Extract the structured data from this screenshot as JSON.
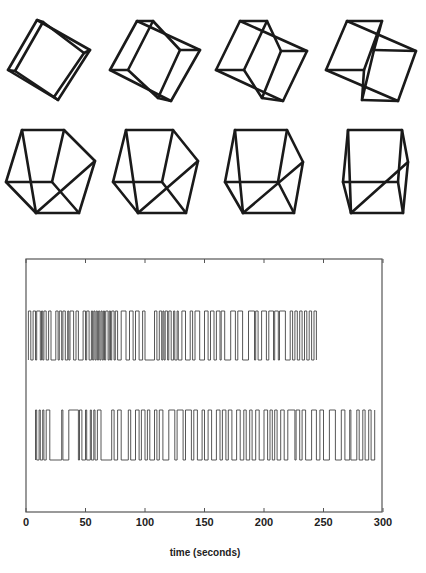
{
  "figure": {
    "cubes": {
      "description": "Necker cube rotation sequence",
      "rows": 2,
      "cols": 4,
      "items": [
        {
          "index": 1,
          "front": [
            [
              37,
              20
            ],
            [
              90,
              50
            ],
            [
              58,
              100
            ],
            [
              8,
              70
            ]
          ],
          "back": [
            [
              43,
              22
            ],
            [
              84,
              53
            ],
            [
              54,
              97
            ],
            [
              15,
              71
            ]
          ]
        },
        {
          "index": 2,
          "front": [
            [
              137,
              21
            ],
            [
              200,
              50
            ],
            [
              171,
              101
            ],
            [
              110,
              70
            ]
          ],
          "back": [
            [
              153,
              21
            ],
            [
              180,
              50
            ],
            [
              158,
              98
            ],
            [
              128,
              70
            ]
          ]
        },
        {
          "index": 3,
          "front": [
            [
              240,
              21
            ],
            [
              307,
              51
            ],
            [
              283,
              101
            ],
            [
              216,
              70
            ]
          ],
          "back": [
            [
              267,
              21
            ],
            [
              281,
              51
            ],
            [
              262,
              98
            ],
            [
              244,
              70
            ]
          ]
        },
        {
          "index": 4,
          "front": [
            [
              347,
              21
            ],
            [
              416,
              51
            ],
            [
              398,
              101
            ],
            [
              326,
              70
            ]
          ],
          "back": [
            [
              382,
              21
            ],
            [
              374,
              50
            ],
            [
              362,
              100
            ],
            [
              364,
              70
            ]
          ]
        },
        {
          "index": 5,
          "front": [
            [
              22,
              130
            ],
            [
              64,
              130
            ],
            [
              95,
              161
            ],
            [
              36,
              213
            ]
          ],
          "back": [
            [
              6,
              182
            ],
            [
              52,
              182
            ],
            [
              79,
              213
            ],
            [
              36,
              213
            ]
          ]
        },
        {
          "index": 6,
          "front": [
            [
              126,
              130
            ],
            [
              173,
              130
            ],
            [
              198,
              161
            ],
            [
              138,
              213
            ]
          ],
          "back": [
            [
              113,
              182
            ],
            [
              162,
              182
            ],
            [
              186,
              213
            ],
            [
              138,
              213
            ]
          ]
        },
        {
          "index": 7,
          "front": [
            [
              235,
              130
            ],
            [
              287,
              130
            ],
            [
              303,
              162
            ],
            [
              243,
              213
            ]
          ],
          "back": [
            [
              225,
              182
            ],
            [
              278,
              182
            ],
            [
              294,
              213
            ],
            [
              243,
              213
            ]
          ]
        },
        {
          "index": 8,
          "front": [
            [
              348,
              130
            ],
            [
              402,
              130
            ],
            [
              408,
              162
            ],
            [
              351,
              213
            ]
          ],
          "back": [
            [
              343,
              182
            ],
            [
              398,
              182
            ],
            [
              403,
              213
            ],
            [
              351,
              213
            ]
          ]
        }
      ]
    },
    "xlabel": "time (seconds)"
  },
  "chart_data": {
    "type": "line",
    "title": "",
    "xlabel": "time (seconds)",
    "ylabel": "",
    "xlim": [
      0,
      300
    ],
    "xticks": [
      0,
      50,
      100,
      150,
      200,
      250,
      300
    ],
    "xtick_labels": [
      "0",
      "50",
      "100",
      "150",
      "200",
      "250",
      "300"
    ],
    "grid": false,
    "legend": null,
    "series": [
      {
        "name": "trace-1 (upper)",
        "description": "binary perceptual switching record",
        "t_start": 2,
        "t_end": 245,
        "switch_times": [
          2,
          4,
          6,
          8,
          9,
          12,
          13,
          14,
          15,
          17,
          19,
          21,
          25,
          27,
          28,
          30,
          31,
          33,
          35,
          36,
          37,
          40,
          42,
          44,
          48,
          50,
          51,
          53,
          55,
          56,
          57,
          58,
          59,
          60,
          61,
          62,
          63,
          64,
          65,
          66,
          67,
          69,
          70,
          71,
          72,
          74,
          75,
          77,
          80,
          84,
          87,
          90,
          92,
          95,
          98,
          100,
          108,
          110,
          112,
          114,
          115,
          116,
          117,
          119,
          120,
          122,
          124,
          125,
          127,
          128,
          131,
          134,
          138,
          140,
          142,
          146,
          150,
          153,
          155,
          158,
          160,
          163,
          164,
          167,
          172,
          176,
          178,
          182,
          187,
          192,
          193,
          195,
          198,
          202,
          204,
          208,
          209,
          212,
          213,
          218,
          222,
          224,
          226,
          228,
          230,
          232,
          234,
          236,
          238,
          240,
          242,
          244
        ]
      },
      {
        "name": "trace-2 (lower)",
        "description": "binary perceptual switching record",
        "t_start": 8,
        "t_end": 293,
        "switch_times": [
          8,
          9,
          11,
          12,
          14,
          15,
          17,
          20,
          30,
          31,
          36,
          44,
          45,
          47,
          50,
          51,
          54,
          55,
          57,
          58,
          60,
          63,
          72,
          74,
          77,
          80,
          86,
          88,
          92,
          95,
          97,
          100,
          102,
          104,
          108,
          110,
          112,
          115,
          120,
          125,
          127,
          132,
          134,
          139,
          141,
          144,
          148,
          150,
          153,
          156,
          160,
          163,
          165,
          168,
          170,
          173,
          177,
          180,
          183,
          185,
          188,
          190,
          193,
          196,
          200,
          203,
          205,
          207,
          209,
          211,
          214,
          217,
          220,
          226,
          227,
          230,
          232,
          235,
          240,
          244,
          247,
          250,
          255,
          260,
          265,
          268,
          272,
          273,
          278,
          280,
          283,
          285,
          288,
          290,
          293
        ]
      }
    ]
  }
}
